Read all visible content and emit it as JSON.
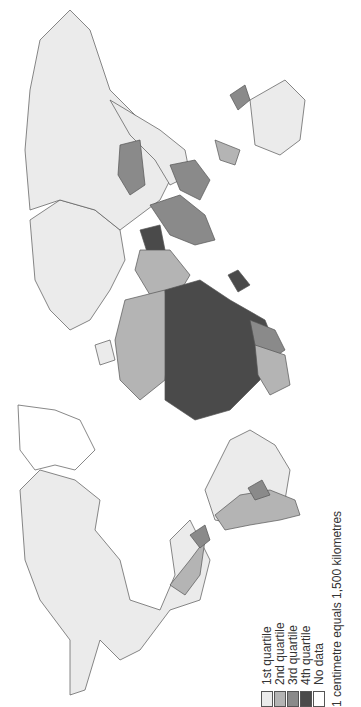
{
  "map": {
    "orientation": "rotated 90 degrees counterclockwise",
    "classes": [
      {
        "label": "1st quartile",
        "color": "#ebebeb"
      },
      {
        "label": "2nd quartile",
        "color": "#b4b4b4"
      },
      {
        "label": "3rd quartile",
        "color": "#8a8a8a"
      },
      {
        "label": "4th quartile",
        "color": "#4a4a4a"
      },
      {
        "label": "No data",
        "color": "#ffffff"
      }
    ],
    "scale_note": "1 centimetre equals 1,500 kilometres"
  }
}
